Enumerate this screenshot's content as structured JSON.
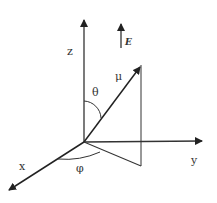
{
  "diagram": {
    "type": "3d-coordinate-system",
    "colors": {
      "line": "#222222",
      "background": "#ffffff"
    },
    "labels": {
      "z_axis": "z",
      "x_axis": "x",
      "y_axis": "y",
      "field": "E",
      "vector": "μ",
      "polar_angle": "θ",
      "azimuth_angle": "φ"
    }
  }
}
